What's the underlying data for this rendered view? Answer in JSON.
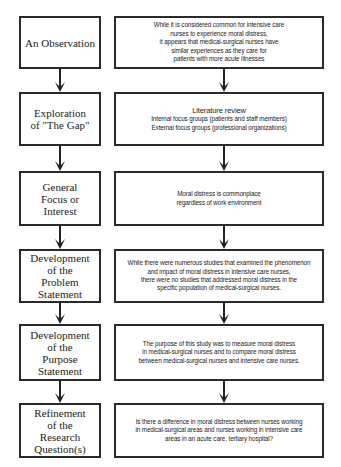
{
  "diagram": {
    "type": "flowchart",
    "rows": [
      {
        "stage": "An Observation",
        "detail": "While it is considered common for intensive care\nnurses to experience moral distress,\nit appears that medical-surgical nurses have\nsimilar experiences as they care for\npatients with more acute illnesses"
      },
      {
        "stage": "Exploration\nof \"The Gap\"",
        "detail_heading": "Literature review",
        "detail": "Internal focus groups (patients and staff members)\nExternal focus groups (professional organizations)"
      },
      {
        "stage": "General\nFocus or\nInterest",
        "detail": "Moral distress is commonplace\nregardless of work environment"
      },
      {
        "stage": "Development\nof the\nProblem\nStatement",
        "detail": "While there were numerous studies that examined the phenomenon\nand impact of moral distress in intensive care nurses,\nthere were no studies that addressed moral distress in the\nspecific population of medical-surgical nurses."
      },
      {
        "stage": "Development\nof the\nPurpose\nStatement",
        "detail": "The purpose of this study was to measure moral distress\nin medical-surgical nurses and to compare moral distress\nbetween medical-surgical nurses and intensive care nurses."
      },
      {
        "stage": "Refinement\nof the\nResearch\nQuestion(s)",
        "detail": "Is there a difference in moral distress between nurses working\nin medical-surgical areas and nurses working in intensive care\nareas in an acute care, tertiary hospital?"
      }
    ],
    "colors": {
      "border": "#2a2a2a",
      "text": "#222222",
      "background": "#ffffff"
    }
  }
}
